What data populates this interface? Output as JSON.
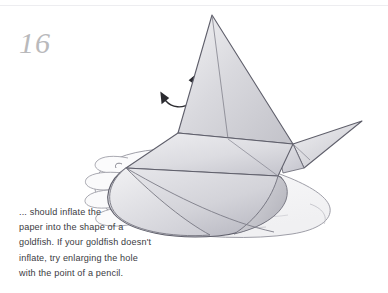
{
  "page": {
    "step_number": "16",
    "background_color": "#ffffff",
    "number_color": "#b9b9bb",
    "text_color": "#3b3b3f",
    "pencil_line_color": "#6e6e78"
  },
  "rotate_symbol": {
    "icon": "circular-rotation-arrow-icon",
    "description": "two-headed circular arrow indicating rotate / turn over",
    "arrowhead_count": 2
  },
  "illustration": {
    "name": "origami-goldfish-in-hand-illustration",
    "medium": "pencil drawing",
    "subjects": [
      "open left hand, palm up, four fingers at left",
      "inflated origami goldfish resting on the palm",
      "upper tail fin pointing up-left",
      "lower tail fin pointing right",
      "rounded inflated paper body"
    ]
  },
  "caption": {
    "lines": [
      "... should inflate the",
      "paper into the shape of a",
      "goldfish. If your goldfish doesn't",
      "inflate, try enlarging the hole",
      "with the point of a pencil."
    ],
    "full_text": "... should inflate the paper into the shape of a goldfish. If your goldfish doesn't inflate, try enlarging the hole with the point of a pencil."
  }
}
